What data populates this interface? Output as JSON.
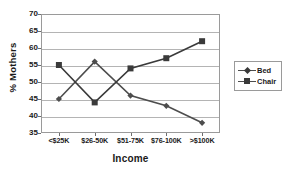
{
  "chart_data": {
    "type": "line",
    "title": "",
    "xlabel": "Income",
    "ylabel": "% Mothers",
    "categories": [
      "<$25K",
      "$26-50K",
      "$51-75K",
      "$76-100K",
      ">$100K"
    ],
    "series": [
      {
        "name": "Bed",
        "marker": "diamond",
        "color": "#4d4d4d",
        "values": [
          45,
          56,
          46,
          43,
          38
        ]
      },
      {
        "name": "Chair",
        "marker": "square",
        "color": "#3a3a3a",
        "values": [
          55,
          44,
          54,
          57,
          62
        ]
      }
    ],
    "ylim": [
      35,
      70
    ],
    "yticks": [
      70,
      65,
      60,
      55,
      50,
      45,
      40,
      35
    ],
    "grid": true,
    "legend_position": "right"
  },
  "legend": {
    "entries": [
      {
        "label": "Bed"
      },
      {
        "label": "Chair"
      }
    ]
  }
}
